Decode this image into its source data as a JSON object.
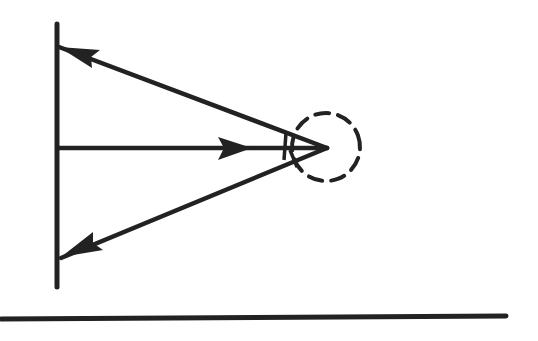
{
  "diagram": {
    "stroke_color": "#222222",
    "background_color": "#ffffff",
    "wall": {
      "x": 57,
      "y1": 24,
      "y2": 287
    },
    "point": {
      "x": 327,
      "y": 148
    },
    "dashed_circle": {
      "cx": 326,
      "cy": 147,
      "r": 34
    },
    "rays": [
      {
        "id": "upper",
        "from": [
          327,
          148
        ],
        "to": [
          59,
          47
        ],
        "direction": "toward-wall"
      },
      {
        "id": "middle",
        "from": [
          59,
          148
        ],
        "to": [
          327,
          148
        ],
        "direction": "toward-point"
      },
      {
        "id": "lower",
        "from": [
          327,
          148
        ],
        "to": [
          61,
          258
        ],
        "direction": "toward-wall"
      }
    ],
    "ground": {
      "x1": 0,
      "y1": 319,
      "x2": 506,
      "y2": 316
    }
  }
}
